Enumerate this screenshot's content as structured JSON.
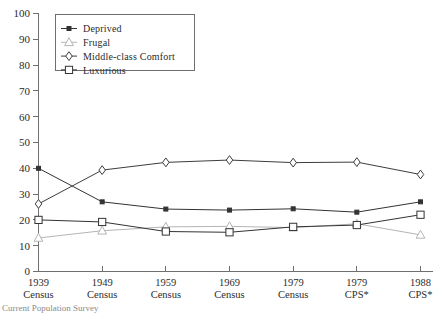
{
  "chart_data": {
    "type": "line",
    "title": "",
    "xlabel": "",
    "ylabel": "",
    "ylim": [
      0,
      100
    ],
    "ytick_step": 10,
    "grid": false,
    "legend_position": "top-left",
    "categories": [
      "1939\nCensus",
      "1949\nCensus",
      "1959\nCensus",
      "1969\nCensus",
      "1979\nCensus",
      "1979\nCPS*",
      "1988\nCPS*"
    ],
    "category_lines": [
      {
        "year": "1939",
        "source": "Census"
      },
      {
        "year": "1949",
        "source": "Census"
      },
      {
        "year": "1959",
        "source": "Census"
      },
      {
        "year": "1969",
        "source": "Census"
      },
      {
        "year": "1979",
        "source": "Census"
      },
      {
        "year": "1979",
        "source": "CPS*"
      },
      {
        "year": "1988",
        "source": "CPS*"
      }
    ],
    "ytick_labels": [
      "0",
      "10",
      "20",
      "30",
      "40",
      "50",
      "60",
      "70",
      "80",
      "90",
      "100"
    ],
    "series": [
      {
        "name": "Deprived",
        "marker": "filled-square",
        "color": "#333333",
        "values": [
          40.0,
          27.0,
          24.2,
          23.8,
          24.3,
          23.0,
          27.0
        ]
      },
      {
        "name": "Frugal",
        "marker": "open-triangle",
        "color": "#b5b5b5",
        "values": [
          13.0,
          15.8,
          17.3,
          17.5,
          17.0,
          18.5,
          14.2
        ]
      },
      {
        "name": "Middle-class Comfort",
        "marker": "open-diamond",
        "color": "#3d3d3d",
        "values": [
          26.2,
          39.3,
          42.3,
          43.2,
          42.2,
          42.4,
          37.6
        ]
      },
      {
        "name": "Luxurious",
        "marker": "open-square",
        "color": "#333333",
        "values": [
          20.0,
          19.2,
          15.5,
          15.2,
          17.3,
          18.0,
          22.0
        ]
      }
    ]
  },
  "legend": {
    "entries": [
      {
        "label": "Deprived"
      },
      {
        "label": "Frugal"
      },
      {
        "label": "Middle-class Comfort"
      },
      {
        "label": "Luxurious"
      }
    ]
  },
  "footnote": {
    "text": "Current Population Survey"
  }
}
